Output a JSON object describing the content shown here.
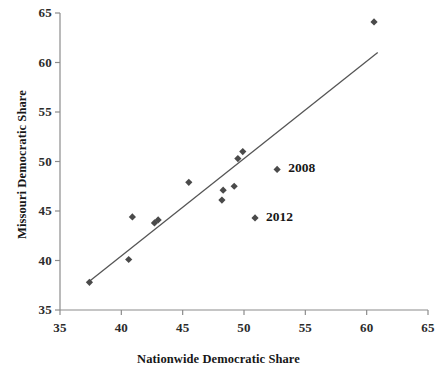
{
  "chart_data": {
    "type": "scatter",
    "title": "",
    "xlabel": "Nationwide Democratic Share",
    "ylabel": "Missouri Democratic Share",
    "xlim": [
      35,
      65
    ],
    "ylim": [
      35,
      65
    ],
    "xticks": [
      35,
      40,
      45,
      50,
      55,
      60,
      65
    ],
    "yticks": [
      35,
      40,
      45,
      50,
      55,
      60,
      65
    ],
    "xtick_labels": [
      "35",
      "40",
      "45",
      "50",
      "55",
      "60",
      "65"
    ],
    "ytick_labels": [
      "35",
      "40",
      "45",
      "50",
      "55",
      "60",
      "65"
    ],
    "grid": false,
    "legend": null,
    "marker": "diamond",
    "marker_color": "#4a4a4a",
    "line_color": "#555555",
    "axis_color": "#808080",
    "points": [
      {
        "x": 37.4,
        "y": 37.8,
        "label": ""
      },
      {
        "x": 40.6,
        "y": 40.1,
        "label": ""
      },
      {
        "x": 40.9,
        "y": 44.4,
        "label": ""
      },
      {
        "x": 42.7,
        "y": 43.8,
        "label": ""
      },
      {
        "x": 43.0,
        "y": 44.1,
        "label": ""
      },
      {
        "x": 45.5,
        "y": 47.9,
        "label": ""
      },
      {
        "x": 48.2,
        "y": 46.1,
        "label": ""
      },
      {
        "x": 48.3,
        "y": 47.1,
        "label": ""
      },
      {
        "x": 49.2,
        "y": 47.5,
        "label": ""
      },
      {
        "x": 49.5,
        "y": 50.3,
        "label": ""
      },
      {
        "x": 49.9,
        "y": 51.0,
        "label": ""
      },
      {
        "x": 52.7,
        "y": 49.2,
        "label": "2008"
      },
      {
        "x": 50.9,
        "y": 44.3,
        "label": "2012"
      },
      {
        "x": 60.6,
        "y": 64.1,
        "label": ""
      }
    ],
    "trendline": {
      "x_start": 37.4,
      "y_start": 37.9,
      "x_end": 60.9,
      "y_end": 61.0
    },
    "annotations": [
      {
        "text": "2008",
        "x": 53.6,
        "y": 49.2
      },
      {
        "text": "2012",
        "x": 51.8,
        "y": 44.3
      }
    ]
  }
}
